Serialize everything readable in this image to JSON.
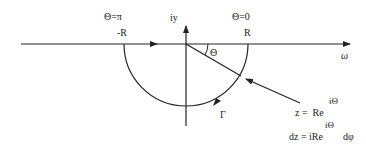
{
  "diagram": {
    "type": "contour-integral",
    "labels": {
      "theta_pi": "Θ=π",
      "minus_r": "-R",
      "imag_axis": "iy",
      "theta_zero": "Θ=0",
      "r": "R",
      "theta_angle": "Θ",
      "real_axis": "ω",
      "gamma": "Γ",
      "z_eq": "z =  Re",
      "z_exp": "iΘ",
      "dz_eq": "dz = iRe",
      "dz_exp": "iΘ",
      "dz_tail": "dφ"
    },
    "colors": {
      "stroke": "#222222",
      "background": "#ffffff"
    }
  }
}
